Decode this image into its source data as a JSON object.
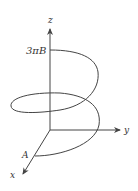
{
  "diagram": {
    "type": "3d-helix-axes",
    "axes": {
      "x_label": "x",
      "y_label": "y",
      "z_label": "z"
    },
    "labels": {
      "top": "3πB",
      "start": "A"
    },
    "colors": {
      "stroke": "#444444",
      "text": "#333333"
    }
  }
}
